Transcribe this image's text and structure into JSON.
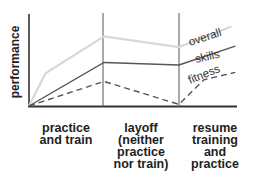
{
  "chart_data": {
    "type": "line",
    "title": "",
    "ylabel": "performance",
    "xlabel": "",
    "grid": false,
    "phases": [
      {
        "label_lines": [
          "practice",
          "and train"
        ]
      },
      {
        "label_lines": [
          "layoff",
          "(neither",
          "practice",
          "nor train)"
        ]
      },
      {
        "label_lines": [
          "resume",
          "training",
          "and",
          "practice"
        ]
      }
    ],
    "x_range": [
      0,
      3
    ],
    "y_range": [
      0,
      100
    ],
    "series": [
      {
        "name": "overall",
        "color": "#d8d8d8",
        "style": "solid",
        "points": [
          [
            0,
            0
          ],
          [
            0.22,
            40
          ],
          [
            1,
            85
          ],
          [
            2,
            72
          ],
          [
            2.7,
            97
          ]
        ]
      },
      {
        "name": "skills",
        "color": "#555555",
        "style": "solid",
        "points": [
          [
            0,
            0
          ],
          [
            1,
            53
          ],
          [
            2,
            50
          ],
          [
            2.75,
            73
          ]
        ]
      },
      {
        "name": "fitness",
        "color": "#555555",
        "style": "dashed",
        "points": [
          [
            0,
            0
          ],
          [
            1,
            30
          ],
          [
            2,
            2
          ],
          [
            2.33,
            32
          ],
          [
            2.75,
            41
          ]
        ]
      }
    ]
  }
}
